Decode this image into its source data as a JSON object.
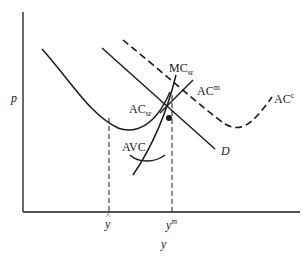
{
  "diagram": {
    "type": "economics cost curves",
    "axes": {
      "y_label": "p",
      "x_label": "y"
    },
    "x_ticks": [
      {
        "base": "y",
        "hat": "^",
        "label": "ŷ"
      },
      {
        "base": "y",
        "sup": "m",
        "label": "y^m"
      }
    ],
    "curves": [
      {
        "id": "AC_sr",
        "base": "AC",
        "sub": "sr",
        "style": "solid"
      },
      {
        "id": "MC_sr",
        "base": "MC",
        "sub": "sr",
        "style": "solid"
      },
      {
        "id": "AC_m",
        "base": "AC",
        "sup": "m",
        "style": "solid"
      },
      {
        "id": "AC_c",
        "base": "AC",
        "sup": "c",
        "style": "dashed"
      },
      {
        "id": "AVC",
        "base": "AVC",
        "style": "solid"
      },
      {
        "id": "D",
        "base": "D",
        "style": "solid"
      }
    ],
    "colors": {
      "line": "#1a1a1a",
      "background": "#ffffff"
    }
  }
}
